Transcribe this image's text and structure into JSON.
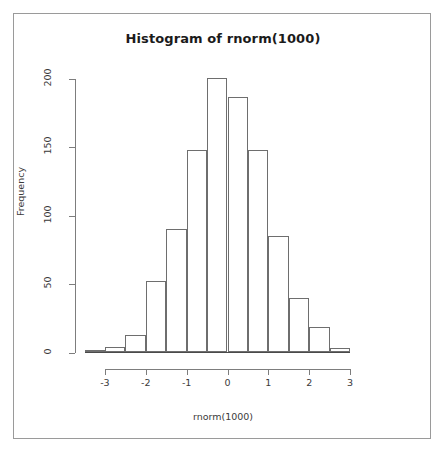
{
  "figure": {
    "title": "Histogram of rnorm(1000)",
    "frame_color": "#9a9a9a",
    "background": "#ffffff",
    "bar_outline_color": "#6e6e6e",
    "bar_fill_color": "#ffffff",
    "axis_color": "#7d7d7d"
  },
  "chart_data": {
    "type": "bar",
    "title": "Histogram of rnorm(1000)",
    "xlabel": "rnorm(1000)",
    "ylabel": "Frequency",
    "grid": false,
    "legend": false,
    "xlim": [
      -3.5,
      3.5
    ],
    "ylim": [
      0,
      210
    ],
    "xticks": [
      -3,
      -2,
      -1,
      0,
      1,
      2,
      3
    ],
    "xtick_labels": [
      "-3",
      "-2",
      "-1",
      "0",
      "1",
      "2",
      "3"
    ],
    "yticks": [
      0,
      50,
      100,
      150,
      200
    ],
    "ytick_labels": [
      "0",
      "50",
      "100",
      "150",
      "200"
    ],
    "bin_width": 0.5,
    "bin_edges": [
      -3.5,
      -3.0,
      -2.5,
      -2.0,
      -1.5,
      -1.0,
      -0.5,
      0.0,
      0.5,
      1.0,
      1.5,
      2.0,
      2.5,
      3.0
    ],
    "bin_centers": [
      -3.25,
      -2.75,
      -2.25,
      -1.75,
      -1.25,
      -0.75,
      -0.25,
      0.25,
      0.75,
      1.25,
      1.75,
      2.25,
      2.75
    ],
    "categories": [
      "-3.5 to -3.0",
      "-3.0 to -2.5",
      "-2.5 to -2.0",
      "-2.0 to -1.5",
      "-1.5 to -1.0",
      "-1.0 to -0.5",
      "-0.5 to 0.0",
      "0.0 to 0.5",
      "0.5 to 1.0",
      "1.0 to 1.5",
      "1.5 to 2.0",
      "2.0 to 2.5",
      "2.5 to 3.0"
    ],
    "values": [
      2,
      4,
      13,
      52,
      90,
      148,
      201,
      187,
      148,
      85,
      40,
      19,
      3
    ]
  }
}
